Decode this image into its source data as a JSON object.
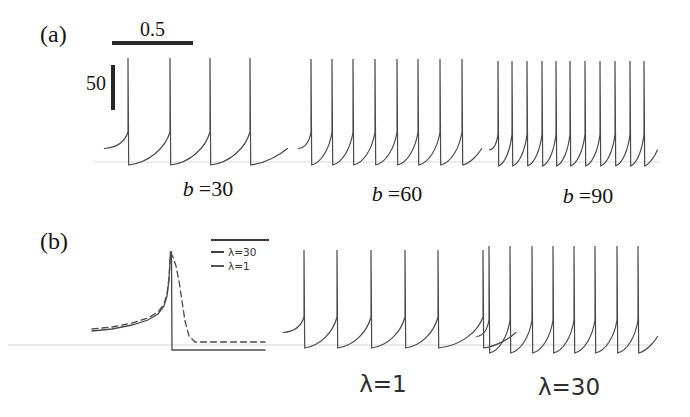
{
  "colors": {
    "trace": "#4a4a4a",
    "scale_bar": "#272727",
    "text": "#161616"
  },
  "panel_a": {
    "label": "(a)",
    "time_scale_label": "0.5",
    "voltage_scale_label": "50",
    "trains": [
      {
        "var": "b",
        "val": "=30"
      },
      {
        "var": "b",
        "val": "=60"
      },
      {
        "var": "b",
        "val": "=90"
      }
    ]
  },
  "panel_b": {
    "label": "(b)",
    "legend": [
      {
        "label": "λ=30"
      },
      {
        "label": "λ=1"
      }
    ],
    "trains": [
      {
        "label": "λ=1"
      },
      {
        "label": "λ=30"
      }
    ]
  },
  "chart_data": {
    "type": "line",
    "scale_bars": {
      "time": "0.5",
      "voltage": "50"
    },
    "panels": [
      {
        "id": "a",
        "trains": [
          {
            "name": "b=30",
            "n_spikes": 4,
            "y_top": 58,
            "y_knee": 132,
            "y_base": 165,
            "spike_x": [
              128,
              170,
              210,
              250
            ]
          },
          {
            "name": "b=60",
            "n_spikes": 8,
            "y_top": 59,
            "y_knee": 132,
            "y_base": 165,
            "spike_x": [
              311,
              332,
              353,
              375,
              397,
              418,
              440,
              462
            ]
          },
          {
            "name": "b=90",
            "n_spikes": 11,
            "y_top": 61,
            "y_knee": 134,
            "y_base": 166,
            "spike_x": [
              498,
              512,
              527,
              542,
              556,
              570,
              585,
              600,
              615,
              630,
              644
            ]
          }
        ]
      },
      {
        "id": "b",
        "trains": [
          {
            "name": "λ=1",
            "n_spikes": 6,
            "y_top": 250,
            "y_knee": 317,
            "y_base": 348,
            "spike_x": [
              304,
              337,
              371,
              405,
              438,
              483
            ]
          },
          {
            "name": "λ=30",
            "n_spikes": 8,
            "y_top": 246,
            "y_knee": 320,
            "y_base": 353,
            "spike_x": [
              489,
              510,
              532,
              553,
              574,
              595,
              617,
              638
            ]
          }
        ],
        "inset": {
          "series": [
            {
              "name": "λ=30",
              "style": "dashed",
              "points": [
                [
                  92,
                  329
                ],
                [
                  112,
                  327
                ],
                [
                  132,
                  323
                ],
                [
                  148,
                  318
                ],
                [
                  158,
                  312
                ],
                [
                  164,
                  304
                ],
                [
                  167,
                  294
                ],
                [
                  169,
                  278
                ],
                [
                  170.5,
                  253
                ],
                [
                  173,
                  257
                ],
                [
                  176,
                  266
                ],
                [
                  179,
                  281
                ],
                [
                  182,
                  301
                ],
                [
                  185,
                  321
                ],
                [
                  189,
                  336
                ],
                [
                  195,
                  342
                ],
                [
                  265,
                  342
                ]
              ]
            },
            {
              "name": "λ=1",
              "style": "solid",
              "points": [
                [
                  92,
                  331
                ],
                [
                  112,
                  329
                ],
                [
                  132,
                  325
                ],
                [
                  148,
                  320
                ],
                [
                  158,
                  314
                ],
                [
                  164,
                  306
                ],
                [
                  167,
                  296
                ],
                [
                  169,
                  280
                ],
                [
                  170.5,
                  252
                ],
                [
                  171.5,
                  252
                ],
                [
                  172,
                  350
                ],
                [
                  265,
                  350
                ]
              ]
            }
          ]
        }
      }
    ]
  }
}
